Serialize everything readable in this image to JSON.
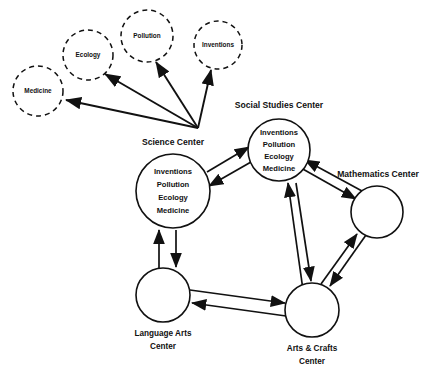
{
  "diagram": {
    "type": "network-diagram",
    "title": "",
    "background_color": "#ffffff",
    "stroke_color": "#111111",
    "centers": [
      {
        "id": "science",
        "label": "Science Center",
        "label_position": "above",
        "shape": "circle",
        "border": "solid",
        "cx": 173,
        "cy": 191,
        "r": 37,
        "items": [
          "Inventions",
          "Pollution",
          "Ecology",
          "Medicine"
        ]
      },
      {
        "id": "social-studies",
        "label": "Social Studies Center",
        "label_position": "above",
        "shape": "circle",
        "border": "solid",
        "cx": 279,
        "cy": 150,
        "r": 31,
        "items": [
          "Inventions",
          "Pollution",
          "Ecology",
          "Medicine"
        ]
      },
      {
        "id": "mathematics",
        "label": "Mathematics Center",
        "label_position": "above-left",
        "shape": "circle",
        "border": "solid",
        "cx": 377,
        "cy": 212,
        "r": 26,
        "items": []
      },
      {
        "id": "arts-crafts",
        "label": "Arts & Crafts Center",
        "label_lines": [
          "Arts & Crafts",
          "Center"
        ],
        "label_position": "below",
        "shape": "circle",
        "border": "solid",
        "cx": 312,
        "cy": 310,
        "r": 27,
        "items": []
      },
      {
        "id": "language-arts",
        "label": "Language Arts Center",
        "label_lines": [
          "Language Arts",
          "Center"
        ],
        "label_position": "below",
        "shape": "circle",
        "border": "solid",
        "cx": 163,
        "cy": 295,
        "r": 27,
        "items": []
      }
    ],
    "topics": [
      {
        "id": "medicine",
        "label": "Medicine",
        "shape": "circle",
        "border": "dashed",
        "cx": 38,
        "cy": 91,
        "r": 25
      },
      {
        "id": "ecology",
        "label": "Ecology",
        "shape": "circle",
        "border": "dashed",
        "cx": 88,
        "cy": 55,
        "r": 25
      },
      {
        "id": "pollution",
        "label": "Pollution",
        "shape": "circle",
        "border": "dashed",
        "cx": 147,
        "cy": 36,
        "r": 26
      },
      {
        "id": "inventions",
        "label": "Inventions",
        "shape": "circle",
        "border": "dashed",
        "cx": 218,
        "cy": 45,
        "r": 24
      }
    ],
    "fan_origin": {
      "x": 198,
      "y": 128,
      "source": "science"
    },
    "fan_edges": [
      {
        "from": "science",
        "to": "medicine",
        "direction": "one-way"
      },
      {
        "from": "science",
        "to": "ecology",
        "direction": "one-way"
      },
      {
        "from": "science",
        "to": "pollution",
        "direction": "one-way"
      },
      {
        "from": "science",
        "to": "inventions",
        "direction": "one-way"
      }
    ],
    "center_edges": [
      {
        "from": "science",
        "to": "social-studies",
        "direction": "two-way"
      },
      {
        "from": "social-studies",
        "to": "mathematics",
        "direction": "two-way"
      },
      {
        "from": "mathematics",
        "to": "arts-crafts",
        "direction": "two-way"
      },
      {
        "from": "arts-crafts",
        "to": "language-arts",
        "direction": "two-way"
      },
      {
        "from": "language-arts",
        "to": "science",
        "direction": "two-way"
      },
      {
        "from": "social-studies",
        "to": "arts-crafts",
        "direction": "two-way"
      }
    ]
  }
}
